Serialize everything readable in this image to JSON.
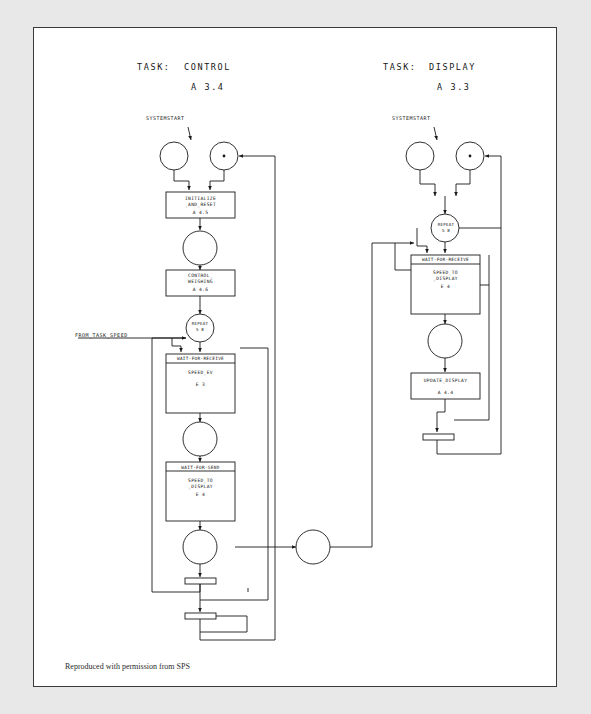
{
  "page": {
    "footer_note": "Reproduced with permission from SPS",
    "background_color": "#e8e8e8",
    "sheet_color": "#ffffff",
    "line_color": "#1a1a1a"
  },
  "tasks": [
    {
      "id": "control",
      "label": "TASK:",
      "name": "CONTROL",
      "number": "A 3.4",
      "start_label": "SYSTEMSTART",
      "incoming_label": "FROM_TASK_SPEED",
      "boxes": [
        {
          "id": "initialize",
          "header": "",
          "line1": "INITIALIZE",
          "line2": "_AND_RESET",
          "number": "A 4.5"
        },
        {
          "id": "control-weighing",
          "header": "",
          "line1": "CONTROL_",
          "line2": "WEIGHING",
          "number": "A 4.6"
        },
        {
          "id": "wait-for-receive",
          "header": "WAIT-FOR-RECEIVE",
          "line1": "SPEED_EV",
          "line2": "",
          "number": "E 3"
        },
        {
          "id": "wait-for-send",
          "header": "WAIT-FOR-SEND",
          "line1": "SPEED_TO",
          "line2": "_DISPLAY",
          "number": "E 4"
        }
      ],
      "repeat": {
        "label": "REPEAT",
        "count": "5 8"
      }
    },
    {
      "id": "display",
      "label": "TASK:",
      "name": "DISPLAY",
      "number": "A 3.3",
      "start_label": "SYSTEMSTART",
      "boxes": [
        {
          "id": "wait-for-receive-disp",
          "header": "WAIT-FOR-RECEIVE",
          "line1": "SPEED_TO",
          "line2": "_DISPLAY",
          "number": "E 4"
        },
        {
          "id": "update-display",
          "header": "",
          "line1": "UPDATE_DISPLAY",
          "line2": "",
          "number": "A 4.4"
        }
      ],
      "repeat": {
        "label": "REPEAT",
        "count": "5 8"
      }
    }
  ]
}
